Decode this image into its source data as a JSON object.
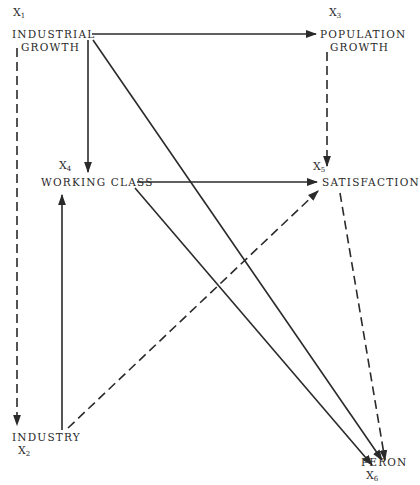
{
  "diagram": {
    "type": "path-diagram",
    "nodes": [
      {
        "id": "x1",
        "var": "X",
        "sub": "1",
        "lines": [
          "INDUSTRIAL",
          "GROWTH"
        ]
      },
      {
        "id": "x2",
        "var": "X",
        "sub": "2",
        "lines": [
          "INDUSTRY"
        ]
      },
      {
        "id": "x3",
        "var": "X",
        "sub": "3",
        "lines": [
          "POPULATION",
          "GROWTH"
        ]
      },
      {
        "id": "x4",
        "var": "X",
        "sub": "4",
        "lines": [
          "WORKING CLASS"
        ]
      },
      {
        "id": "x5",
        "var": "X",
        "sub": "5",
        "lines": [
          "SATISFACTION"
        ]
      },
      {
        "id": "x6",
        "var": "X",
        "sub": "6",
        "lines": [
          "PERON"
        ]
      }
    ],
    "edges": [
      {
        "from": "x1",
        "to": "x3",
        "style": "solid"
      },
      {
        "from": "x1",
        "to": "x4",
        "style": "solid"
      },
      {
        "from": "x1",
        "to": "x6",
        "style": "solid"
      },
      {
        "from": "x1",
        "to": "x2",
        "style": "dashed"
      },
      {
        "from": "x3",
        "to": "x5",
        "style": "dashed"
      },
      {
        "from": "x4",
        "to": "x5",
        "style": "solid"
      },
      {
        "from": "x4",
        "to": "x6",
        "style": "solid"
      },
      {
        "from": "x2",
        "to": "x4",
        "style": "solid"
      },
      {
        "from": "x2",
        "to": "x5",
        "style": "dashed"
      },
      {
        "from": "x5",
        "to": "x6",
        "style": "dashed"
      }
    ],
    "colors": {
      "ink": "#2a2a2a",
      "background": "#ffffff"
    }
  }
}
